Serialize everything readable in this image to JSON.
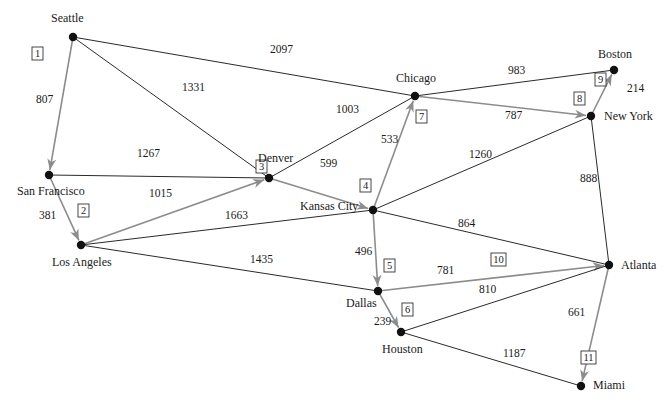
{
  "colors": {
    "edge": "#2a2a2a",
    "tree_edge": "#8c8c8c",
    "node": "#111111",
    "background": "#ffffff"
  },
  "nodes": [
    {
      "id": "seattle",
      "label": "Seattle",
      "x": 73,
      "y": 37,
      "lx": 51,
      "ly": 22,
      "anchor": "start"
    },
    {
      "id": "sanfrancisco",
      "label": "San Francisco",
      "x": 49,
      "y": 175,
      "lx": 17,
      "ly": 195,
      "anchor": "start"
    },
    {
      "id": "losangeles",
      "label": "Los Angeles",
      "x": 81,
      "y": 245,
      "lx": 52,
      "ly": 266,
      "anchor": "start"
    },
    {
      "id": "denver",
      "label": "Denver",
      "x": 269,
      "y": 178,
      "lx": 258,
      "ly": 162,
      "anchor": "start"
    },
    {
      "id": "kansascity",
      "label": "Kansas City",
      "x": 373,
      "y": 210,
      "lx": 300,
      "ly": 210,
      "anchor": "start"
    },
    {
      "id": "chicago",
      "label": "Chicago",
      "x": 415,
      "y": 96,
      "lx": 396,
      "ly": 82,
      "anchor": "start"
    },
    {
      "id": "boston",
      "label": "Boston",
      "x": 614,
      "y": 70,
      "lx": 598,
      "ly": 58,
      "anchor": "start"
    },
    {
      "id": "newyork",
      "label": "New York",
      "x": 591,
      "y": 116,
      "lx": 604,
      "ly": 120,
      "anchor": "start"
    },
    {
      "id": "atlanta",
      "label": "Atlanta",
      "x": 609,
      "y": 265,
      "lx": 621,
      "ly": 269,
      "anchor": "start"
    },
    {
      "id": "dallas",
      "label": "Dallas",
      "x": 378,
      "y": 291,
      "lx": 346,
      "ly": 307,
      "anchor": "start"
    },
    {
      "id": "houston",
      "label": "Houston",
      "x": 401,
      "y": 332,
      "lx": 382,
      "ly": 353,
      "anchor": "start"
    },
    {
      "id": "miami",
      "label": "Miami",
      "x": 581,
      "y": 386,
      "lx": 593,
      "ly": 389,
      "anchor": "start"
    }
  ],
  "edges": [
    {
      "from": "seattle",
      "to": "sanfrancisco",
      "weight": "807",
      "wx": 36,
      "wy": 103,
      "tree": true,
      "order": "1",
      "ox": 33,
      "oy": 57
    },
    {
      "from": "sanfrancisco",
      "to": "losangeles",
      "weight": "381",
      "wx": 39,
      "wy": 219,
      "tree": true,
      "order": "2",
      "ox": 79,
      "oy": 214
    },
    {
      "from": "losangeles",
      "to": "denver",
      "weight": "1015",
      "wx": 149,
      "wy": 197,
      "tree": true,
      "order": "3",
      "ox": 257,
      "oy": 170
    },
    {
      "from": "denver",
      "to": "kansascity",
      "weight": "599",
      "wx": 320,
      "wy": 167,
      "tree": true,
      "order": "4",
      "ox": 361,
      "oy": 189
    },
    {
      "from": "kansascity",
      "to": "dallas",
      "weight": "496",
      "wx": 355,
      "wy": 255,
      "tree": true,
      "order": "5",
      "ox": 385,
      "oy": 269
    },
    {
      "from": "dallas",
      "to": "houston",
      "weight": "239",
      "wx": 374,
      "wy": 325,
      "tree": true,
      "order": "6",
      "ox": 403,
      "oy": 313
    },
    {
      "from": "kansascity",
      "to": "chicago",
      "weight": "533",
      "wx": 381,
      "wy": 143,
      "tree": true,
      "order": "7",
      "ox": 417,
      "oy": 120
    },
    {
      "from": "chicago",
      "to": "newyork",
      "weight": "787",
      "wx": 505,
      "wy": 119,
      "tree": true,
      "order": "8",
      "ox": 575,
      "oy": 102
    },
    {
      "from": "newyork",
      "to": "boston",
      "weight": "214",
      "wx": 627,
      "wy": 92,
      "tree": true,
      "order": "9",
      "ox": 596,
      "oy": 83
    },
    {
      "from": "dallas",
      "to": "atlanta",
      "weight": "781",
      "wx": 437,
      "wy": 274,
      "tree": true,
      "order": "10",
      "ox": 492,
      "oy": 263
    },
    {
      "from": "atlanta",
      "to": "miami",
      "weight": "661",
      "wx": 568,
      "wy": 316,
      "tree": true,
      "order": "11",
      "ox": 582,
      "oy": 361
    },
    {
      "from": "seattle",
      "to": "chicago",
      "weight": "2097",
      "wx": 270,
      "wy": 53,
      "tree": false
    },
    {
      "from": "seattle",
      "to": "denver",
      "weight": "1331",
      "wx": 182,
      "wy": 91,
      "tree": false
    },
    {
      "from": "sanfrancisco",
      "to": "denver",
      "weight": "1267",
      "wx": 137,
      "wy": 157,
      "tree": false
    },
    {
      "from": "losangeles",
      "to": "kansascity",
      "weight": "1663",
      "wx": 225,
      "wy": 219,
      "tree": false
    },
    {
      "from": "losangeles",
      "to": "dallas",
      "weight": "1435",
      "wx": 250,
      "wy": 263,
      "tree": false
    },
    {
      "from": "denver",
      "to": "chicago",
      "weight": "1003",
      "wx": 336,
      "wy": 113,
      "tree": false
    },
    {
      "from": "chicago",
      "to": "boston",
      "weight": "983",
      "wx": 508,
      "wy": 74,
      "tree": false
    },
    {
      "from": "kansascity",
      "to": "newyork",
      "weight": "1260",
      "wx": 469,
      "wy": 158,
      "tree": false
    },
    {
      "from": "kansascity",
      "to": "atlanta",
      "weight": "864",
      "wx": 458,
      "wy": 227,
      "tree": false
    },
    {
      "from": "newyork",
      "to": "atlanta",
      "weight": "888",
      "wx": 580,
      "wy": 182,
      "tree": false
    },
    {
      "from": "atlanta",
      "to": "houston",
      "weight": "810",
      "wx": 479,
      "wy": 293,
      "tree": false
    },
    {
      "from": "houston",
      "to": "miami",
      "weight": "1187",
      "wx": 503,
      "wy": 357,
      "tree": false
    }
  ]
}
